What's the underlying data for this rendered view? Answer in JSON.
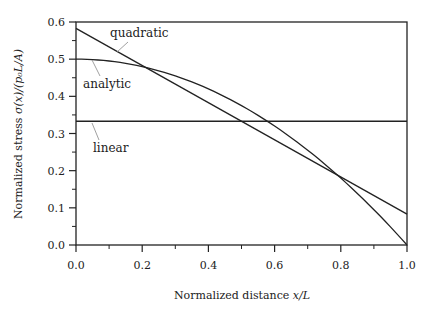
{
  "chart_data": {
    "type": "line",
    "title": "",
    "xlabel": "Normalized distance x/L",
    "ylabel": "Normalized stress σ(x)/(p₀L/A)",
    "xlim": [
      0.0,
      1.0
    ],
    "ylim": [
      0.0,
      0.6
    ],
    "xticks": [
      "0.0",
      "0.2",
      "0.4",
      "0.6",
      "0.8",
      "1.0"
    ],
    "yticks": [
      "0.0",
      "0.1",
      "0.2",
      "0.3",
      "0.4",
      "0.5",
      "0.6"
    ],
    "grid": false,
    "legend": "inline annotations with leader lines",
    "series": [
      {
        "name": "quadratic",
        "x": [
          0.0,
          0.2,
          0.4,
          0.6,
          0.8,
          1.0
        ],
        "values": [
          0.583,
          0.483,
          0.383,
          0.283,
          0.183,
          0.083
        ]
      },
      {
        "name": "analytic",
        "x": [
          0.0,
          0.1,
          0.2,
          0.3,
          0.4,
          0.5,
          0.6,
          0.7,
          0.8,
          0.9,
          1.0
        ],
        "values": [
          0.5,
          0.495,
          0.48,
          0.455,
          0.42,
          0.375,
          0.32,
          0.255,
          0.18,
          0.095,
          0.0
        ]
      },
      {
        "name": "linear",
        "x": [
          0.0,
          1.0
        ],
        "values": [
          0.333,
          0.333
        ]
      }
    ],
    "annotations": [
      "quadratic",
      "analytic",
      "linear"
    ]
  },
  "labels": {
    "xlabel_text": "Normalized distance ",
    "xlabel_math": "x/L",
    "ylabel_text": "Normalized stress ",
    "ylabel_math": "σ(x)/(p₀L/A)",
    "quadratic": "quadratic",
    "analytic": "analytic",
    "linear": "linear"
  }
}
